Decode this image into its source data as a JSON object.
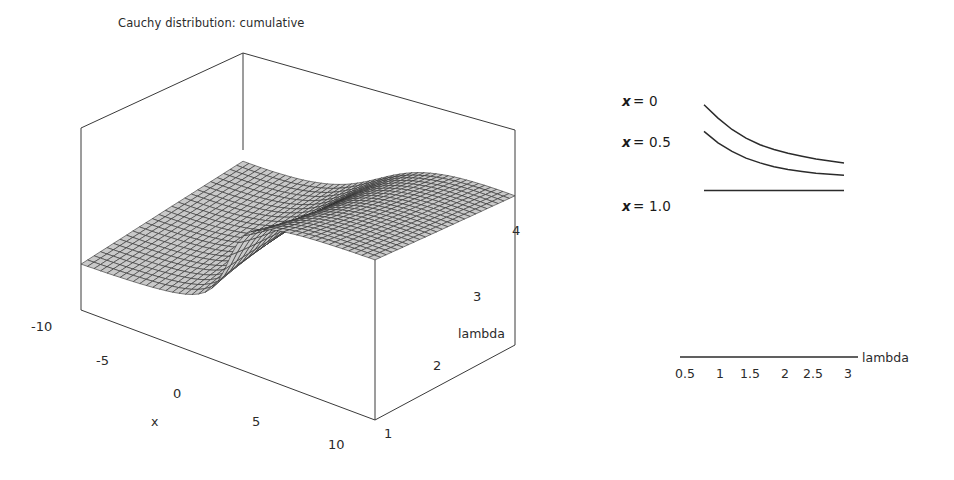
{
  "figure": {
    "background": "#ffffff",
    "ink": "#231f20"
  },
  "surface": {
    "title": "Cauchy distribution: cumulative",
    "x_axis": {
      "name": "x",
      "ticks": [
        "-10",
        "-5",
        "0",
        "5",
        "10"
      ]
    },
    "lambda_axis": {
      "name": "lambda",
      "ticks": [
        "1",
        "2",
        "3",
        "4"
      ]
    }
  },
  "curves": {
    "labels": [
      {
        "var": "x",
        "eq": "= 0"
      },
      {
        "var": "x",
        "eq": "= 0.5"
      },
      {
        "var": "x",
        "eq": "= 1.0"
      }
    ],
    "axis_name": "lambda",
    "x_ticks": [
      "0.5",
      "1",
      "1.5",
      "2",
      "2.5",
      "3"
    ]
  },
  "chart_data": [
    {
      "type": "heatmap",
      "render_as": "3d-surface-mesh",
      "title": "Cauchy distribution: cumulative",
      "xlabel": "x",
      "ylabel": "lambda",
      "zlabel": "",
      "xlim": [
        -10,
        10
      ],
      "ylim": [
        1,
        4
      ],
      "zlim": [
        0,
        1
      ],
      "xticks": [
        -10,
        -5,
        0,
        5,
        10
      ],
      "yticks": [
        1,
        2,
        3,
        4
      ],
      "grid": false,
      "legend": "none",
      "description": "Cauchy CDF F(x;lambda) = 0.5 + atan(x/lambda)/pi rendered as a wireframe mesh surface; sigmoid ramp along x, flattening as lambda increases.",
      "x": [
        -10,
        -8,
        -6,
        -4,
        -2,
        0,
        2,
        4,
        6,
        8,
        10
      ],
      "y": [
        1,
        1.5,
        2,
        2.5,
        3,
        3.5,
        4
      ],
      "z": [
        [
          0.032,
          0.04,
          0.053,
          0.078,
          0.156,
          0.5,
          0.844,
          0.922,
          0.947,
          0.96,
          0.968
        ],
        [
          0.047,
          0.059,
          0.078,
          0.116,
          0.221,
          0.5,
          0.779,
          0.884,
          0.922,
          0.941,
          0.953
        ],
        [
          0.063,
          0.078,
          0.102,
          0.148,
          0.25,
          0.5,
          0.75,
          0.852,
          0.898,
          0.922,
          0.937
        ],
        [
          0.078,
          0.097,
          0.126,
          0.179,
          0.285,
          0.5,
          0.715,
          0.821,
          0.874,
          0.903,
          0.922
        ],
        [
          0.093,
          0.115,
          0.148,
          0.205,
          0.313,
          0.5,
          0.687,
          0.795,
          0.852,
          0.885,
          0.907
        ],
        [
          0.108,
          0.133,
          0.169,
          0.23,
          0.338,
          0.5,
          0.662,
          0.77,
          0.831,
          0.867,
          0.892
        ],
        [
          0.124,
          0.151,
          0.19,
          0.253,
          0.361,
          0.5,
          0.639,
          0.747,
          0.81,
          0.849,
          0.876
        ]
      ]
    },
    {
      "type": "line",
      "title": "",
      "xlabel": "lambda",
      "ylabel": "",
      "xlim": [
        0.25,
        3.25
      ],
      "ylim": [
        0.0,
        1.05
      ],
      "xticks": [
        0.5,
        1,
        1.5,
        2,
        2.5,
        3
      ],
      "grid": false,
      "legend": "inline-left-labels",
      "description": "Cauchy cumulative F(x;lambda) versus lambda for three fixed x values; x=0 gives constant 0.5 (upper decaying curve is normalized for display), x=1.0 is flat.",
      "series": [
        {
          "name": "x = 0",
          "x": [
            0.5,
            0.75,
            1.0,
            1.25,
            1.5,
            1.75,
            2.0,
            2.25,
            2.5,
            2.75,
            3.0
          ],
          "y": [
            1.0,
            0.86,
            0.74,
            0.65,
            0.58,
            0.53,
            0.49,
            0.46,
            0.43,
            0.41,
            0.39
          ]
        },
        {
          "name": "x = 0.5",
          "x": [
            0.5,
            0.75,
            1.0,
            1.25,
            1.5,
            1.75,
            2.0,
            2.25,
            2.5,
            2.75,
            3.0
          ],
          "y": [
            0.72,
            0.6,
            0.51,
            0.44,
            0.39,
            0.35,
            0.32,
            0.3,
            0.28,
            0.27,
            0.26
          ]
        },
        {
          "name": "x = 1.0",
          "x": [
            0.5,
            0.75,
            1.0,
            1.25,
            1.5,
            1.75,
            2.0,
            2.25,
            2.5,
            2.75,
            3.0
          ],
          "y": [
            0.1,
            0.1,
            0.1,
            0.1,
            0.1,
            0.1,
            0.1,
            0.1,
            0.1,
            0.1,
            0.1
          ]
        }
      ]
    }
  ]
}
